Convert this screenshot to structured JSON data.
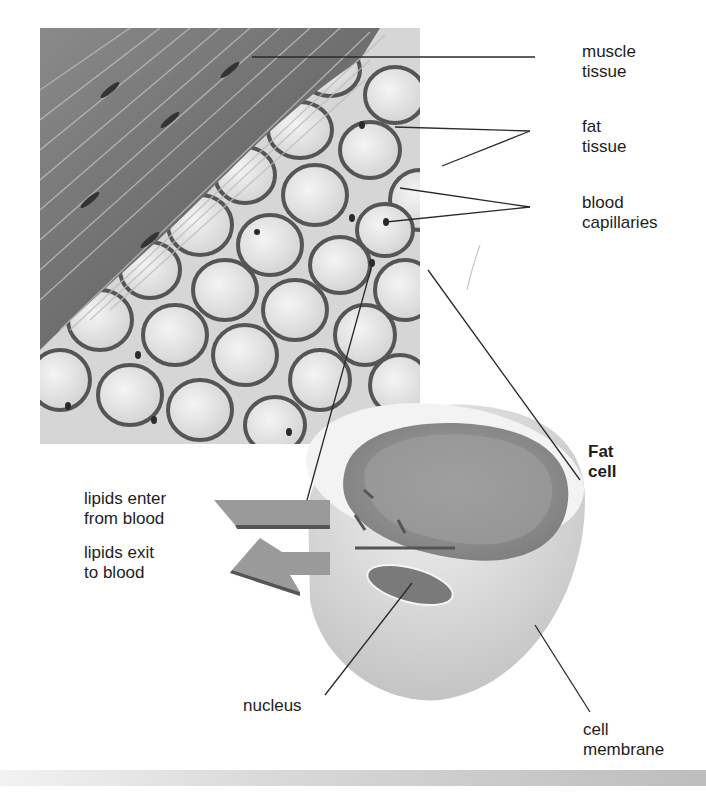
{
  "figure": {
    "regions": [
      "muscle tissue",
      "fat tissue",
      "fat cell cross-section"
    ]
  },
  "labels": {
    "muscle_tissue": "muscle\ntissue",
    "fat_tissue": "fat\ntissue",
    "blood_capillaries": "blood\ncapillaries",
    "fat_cell": "Fat\ncell",
    "lipids_enter": "lipids enter\nfrom blood",
    "lipids_exit": "lipids exit\nto blood",
    "nucleus": "nucleus",
    "cell_membrane": "cell\nmembrane"
  },
  "colors": {
    "muscle": "#7a7a7a",
    "fat_cell_fill": "#e4e4e4",
    "tissue_bg": "#d9d9d9",
    "cytoplasm_dark": "#8c8c8c",
    "leader_line": "#2a2a2a"
  }
}
